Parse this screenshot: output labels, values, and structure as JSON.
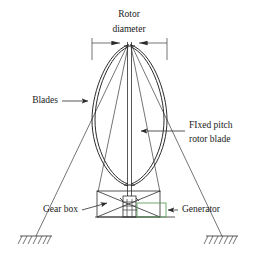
{
  "figure": {
    "background_color": "#ffffff",
    "line_color": "#2b2b2b",
    "accent_color": "#5f9e62"
  },
  "labels": {
    "rotor_diameter_line1": "Rotor",
    "rotor_diameter_line2": "diameter",
    "blades": "Blades",
    "fixed_pitch_line1": "FIxed pitch",
    "fixed_pitch_line2": "rotor blade",
    "gear_box": "Gear box",
    "generator": "Generator"
  },
  "components": {
    "rotor_blades": "troposkein-curved-blades",
    "central_shaft": "vertical-rotor-shaft",
    "guy_wires": "four-guy-wires",
    "support_frame": "cross-braced-base-frame",
    "gearbox_unit": "hatched-gearbox-module",
    "generator_unit": "generator-box",
    "ground_anchor_left": "hatched-ground-support",
    "ground_anchor_right": "hatched-ground-support",
    "dimension_line": "rotor-diameter-dimension"
  }
}
